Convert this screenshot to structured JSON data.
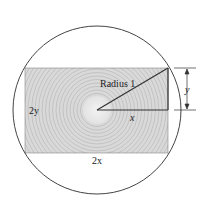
{
  "diagram": {
    "labels": {
      "radius": "Radius 1",
      "x": "x",
      "y": "y",
      "two_y": "2y",
      "two_x": "2x"
    },
    "colors": {
      "rect_fill": "#d9d9d9",
      "ring_stroke": "#bdbdbd",
      "line": "#333333",
      "circle": "#444444"
    }
  }
}
